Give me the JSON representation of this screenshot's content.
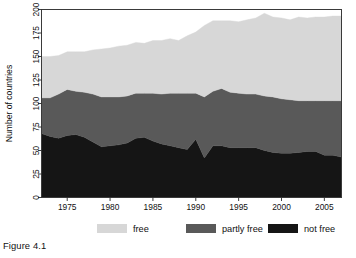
{
  "figure": {
    "caption": "Figure 4.1"
  },
  "chart_data": {
    "type": "area",
    "stacked": true,
    "title": "",
    "xlabel": "",
    "ylabel": "Number of countries",
    "xlim": [
      1972,
      2007
    ],
    "ylim": [
      0,
      200
    ],
    "grid": false,
    "legend_position": "bottom",
    "x": [
      1972,
      1973,
      1974,
      1975,
      1976,
      1977,
      1978,
      1979,
      1980,
      1981,
      1982,
      1983,
      1984,
      1985,
      1986,
      1987,
      1988,
      1989,
      1990,
      1991,
      1992,
      1993,
      1994,
      1995,
      1996,
      1997,
      1998,
      1999,
      2000,
      2001,
      2002,
      2003,
      2004,
      2005,
      2006,
      2007
    ],
    "xticks": [
      1975,
      1980,
      1985,
      1990,
      1995,
      2000,
      2005
    ],
    "yticks": [
      0,
      25,
      50,
      75,
      100,
      125,
      150,
      175,
      200
    ],
    "series": [
      {
        "name": "not free",
        "color": "#151515",
        "values": [
          68,
          65,
          63,
          66,
          67,
          64,
          59,
          54,
          55,
          56,
          58,
          63,
          64,
          60,
          57,
          55,
          53,
          51,
          62,
          42,
          55,
          55,
          53,
          53,
          53,
          53,
          50,
          48,
          47,
          47,
          48,
          49,
          49,
          45,
          45,
          43
        ]
      },
      {
        "name": "partly free",
        "color": "#595959",
        "values": [
          38,
          41,
          47,
          49,
          46,
          48,
          51,
          53,
          52,
          51,
          50,
          48,
          47,
          51,
          53,
          56,
          58,
          60,
          49,
          65,
          58,
          61,
          59,
          58,
          57,
          57,
          58,
          59,
          58,
          57,
          55,
          54,
          54,
          58,
          58,
          60
        ]
      },
      {
        "name": "free",
        "color": "#d7d7d7",
        "values": [
          44,
          44,
          41,
          40,
          42,
          43,
          47,
          51,
          52,
          54,
          54,
          54,
          53,
          56,
          57,
          58,
          56,
          61,
          65,
          76,
          75,
          72,
          76,
          76,
          79,
          81,
          88,
          85,
          86,
          85,
          89,
          88,
          89,
          89,
          90,
          90
        ]
      }
    ],
    "legend": [
      {
        "label": "free",
        "color": "#d7d7d7"
      },
      {
        "label": "partly free",
        "color": "#595959"
      },
      {
        "label": "not free",
        "color": "#151515"
      }
    ]
  }
}
